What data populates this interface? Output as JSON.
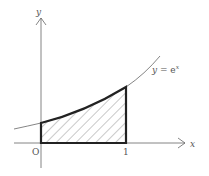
{
  "diagram": {
    "function_label": {
      "lhs": "y",
      "eq": " = ",
      "base": "e",
      "exp": "x"
    },
    "axes": {
      "x_label": "x",
      "y_label": "y",
      "origin_label": "O",
      "x_tick_label": "1"
    },
    "shaded_region": {
      "from": 0,
      "to": 1,
      "pattern": "diagonal-hatch"
    },
    "colors": {
      "line": "#555555",
      "boundary": "#222222",
      "hatch": "#777777",
      "background": "#ffffff"
    }
  }
}
